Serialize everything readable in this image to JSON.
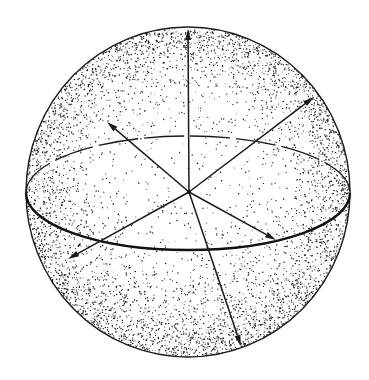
{
  "figure": {
    "background": "#ffffff",
    "ink": "#1a1a1a",
    "sphere": {
      "cx": 188,
      "cy": 192,
      "rx": 162,
      "ry": 165
    },
    "equator": {
      "cx": 188,
      "cy": 193,
      "rx": 162,
      "ry": 57,
      "back_dashed": true
    },
    "center": {
      "x": 189,
      "y": 192
    },
    "arrows": [
      {
        "name": "arrow-up",
        "x": 188,
        "y": 29
      },
      {
        "name": "arrow-upper-right",
        "x": 314,
        "y": 97
      },
      {
        "name": "arrow-upper-left",
        "x": 107,
        "y": 122
      },
      {
        "name": "arrow-right-equator",
        "x": 276,
        "y": 240
      },
      {
        "name": "arrow-lower-left",
        "x": 68,
        "y": 259
      },
      {
        "name": "arrow-down",
        "x": 241,
        "y": 346
      }
    ],
    "stipple": {
      "seed": 7,
      "count": 5200
    }
  }
}
